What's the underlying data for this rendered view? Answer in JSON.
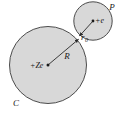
{
  "figure": {
    "type": "physics-diagram",
    "background_color": "#ffffff",
    "width": 123,
    "height": 118,
    "circle_fill": "#d8d8d8",
    "circle_stroke": "#3a3a3a",
    "label_color": "#1a1a1a"
  },
  "labels": {
    "nucleus_charge": "+Ze",
    "electron_charge": "+e",
    "radius_large": "R",
    "radius_small_base": "r",
    "radius_small_sub": "0",
    "body_large": "C",
    "body_small": "P"
  },
  "geometry": {
    "large_circle": {
      "cx": 48,
      "cy": 65,
      "r": 39
    },
    "small_circle": {
      "cx": 93,
      "cy": 21,
      "r": 19.5
    },
    "arrow_R": {
      "x1": 48,
      "y1": 65,
      "x2": 79.5,
      "y2": 38.5
    },
    "arrow_r0": {
      "x1": 93,
      "y1": 21,
      "x2": 78.5,
      "y2": 37
    }
  }
}
